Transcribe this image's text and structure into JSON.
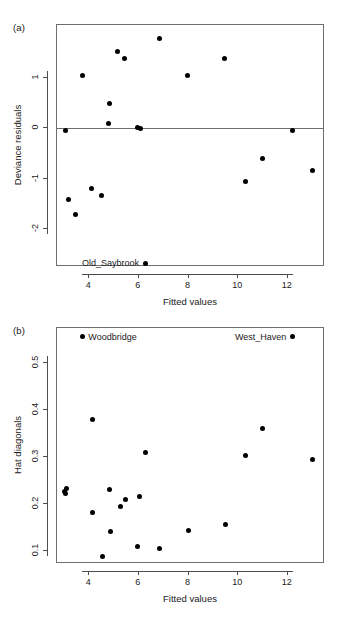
{
  "figure": {
    "width": 340,
    "height": 622,
    "background": "#ffffff",
    "point_color": "#000000",
    "axis_color": "#4d4d4d",
    "box_color": "#6e6e6e"
  },
  "panels": [
    {
      "tag": "(a)",
      "tag_x": 13,
      "tag_y": 22,
      "box": {
        "left": 56,
        "top": 24,
        "width": 268,
        "height": 242
      },
      "chart_data": {
        "type": "scatter",
        "title": "",
        "xlabel": "Fitted values",
        "ylabel": "Deviance residuals",
        "xlim": [
          2.7,
          13.5
        ],
        "ylim": [
          -2.75,
          2.05
        ],
        "grid": false,
        "legend": "none",
        "xticks": [
          4,
          6,
          8,
          10,
          12
        ],
        "xticklabels": [
          "4",
          "6",
          "8",
          "10",
          "12"
        ],
        "yticks": [
          1,
          0,
          -1,
          -2
        ],
        "yticklabels": [
          "1",
          "0",
          "-1",
          "-2"
        ],
        "reference_line": {
          "orientation": "horizontal",
          "y": 0
        },
        "points": [
          {
            "x": 3.05,
            "y": -0.05
          },
          {
            "x": 3.15,
            "y": -1.41
          },
          {
            "x": 3.45,
            "y": -1.7
          },
          {
            "x": 3.72,
            "y": 1.04
          },
          {
            "x": 4.1,
            "y": -1.2
          },
          {
            "x": 4.5,
            "y": -1.34
          },
          {
            "x": 4.76,
            "y": 0.1
          },
          {
            "x": 4.8,
            "y": 0.5
          },
          {
            "x": 5.15,
            "y": 1.52
          },
          {
            "x": 5.4,
            "y": 1.39
          },
          {
            "x": 5.95,
            "y": 0.02
          },
          {
            "x": 6.05,
            "y": -0.01
          },
          {
            "x": 6.25,
            "y": -2.68
          },
          {
            "x": 6.83,
            "y": 1.78
          },
          {
            "x": 7.95,
            "y": 1.04
          },
          {
            "x": 9.43,
            "y": 1.39
          },
          {
            "x": 10.3,
            "y": -1.06
          },
          {
            "x": 11.0,
            "y": -0.6
          },
          {
            "x": 12.2,
            "y": -0.04
          },
          {
            "x": 12.98,
            "y": -0.84
          }
        ],
        "annotations": [
          {
            "text": "Old_Saybrook",
            "x": 6.25,
            "y": -2.68,
            "align": "right"
          }
        ]
      }
    },
    {
      "tag": "(b)",
      "tag_x": 13,
      "tag_y": 325,
      "box": {
        "left": 56,
        "top": 327,
        "width": 268,
        "height": 236
      },
      "chart_data": {
        "type": "scatter",
        "title": "",
        "xlabel": "Fitted values",
        "ylabel": "Hat diagonals",
        "xlim": [
          2.7,
          13.5
        ],
        "ylim": [
          0.073,
          0.575
        ],
        "grid": false,
        "legend": "none",
        "xticks": [
          4,
          6,
          8,
          10,
          12
        ],
        "xticklabels": [
          "4",
          "6",
          "8",
          "10",
          "12"
        ],
        "yticks": [
          0.5,
          0.4,
          0.3,
          0.2,
          0.1
        ],
        "yticklabels": [
          "0.5",
          "0.4",
          "0.3",
          "0.2",
          "0.1"
        ],
        "points": [
          {
            "x": 3.02,
            "y": 0.227
          },
          {
            "x": 3.08,
            "y": 0.234
          },
          {
            "x": 3.05,
            "y": 0.222
          },
          {
            "x": 3.72,
            "y": 0.556
          },
          {
            "x": 4.12,
            "y": 0.381
          },
          {
            "x": 4.15,
            "y": 0.182
          },
          {
            "x": 4.53,
            "y": 0.09
          },
          {
            "x": 4.8,
            "y": 0.232
          },
          {
            "x": 4.85,
            "y": 0.142
          },
          {
            "x": 5.24,
            "y": 0.196
          },
          {
            "x": 5.45,
            "y": 0.21
          },
          {
            "x": 5.95,
            "y": 0.11
          },
          {
            "x": 6.02,
            "y": 0.217
          },
          {
            "x": 6.25,
            "y": 0.31
          },
          {
            "x": 6.85,
            "y": 0.105
          },
          {
            "x": 7.98,
            "y": 0.145
          },
          {
            "x": 9.5,
            "y": 0.156
          },
          {
            "x": 10.3,
            "y": 0.304
          },
          {
            "x": 11.0,
            "y": 0.361
          },
          {
            "x": 12.18,
            "y": 0.556
          },
          {
            "x": 12.98,
            "y": 0.296
          }
        ],
        "annotations": [
          {
            "text": "Woodbridge",
            "x": 3.72,
            "y": 0.556,
            "align": "left"
          },
          {
            "text": "West_Haven",
            "x": 12.18,
            "y": 0.556,
            "align": "right"
          }
        ]
      }
    }
  ]
}
